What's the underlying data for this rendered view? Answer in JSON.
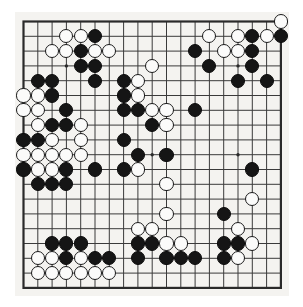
{
  "figure": {
    "name": "go-board-position",
    "board_size": 19,
    "colors": {
      "board_background": "#f4f3f0",
      "grid_line": "#3a3a3a",
      "border_line": "#2a2a2a",
      "black_stone": "#151515",
      "white_stone": "#fbfbfa",
      "page_background": "#ffffff"
    },
    "geometry": {
      "origin_x": 8.5,
      "origin_y": 9.5,
      "step_x": 14.3,
      "step_y": 14.8,
      "stone_diameter": 14.2,
      "border_width": 2.2,
      "grid_width": 1.0
    },
    "star_points": [
      [
        3,
        3
      ],
      [
        9,
        3
      ],
      [
        15,
        3
      ],
      [
        3,
        9
      ],
      [
        9,
        9
      ],
      [
        15,
        9
      ],
      [
        3,
        15
      ],
      [
        9,
        15
      ],
      [
        15,
        15
      ]
    ],
    "stones": [
      {
        "c": 3,
        "r": 1,
        "color": "white"
      },
      {
        "c": 4,
        "r": 1,
        "color": "white"
      },
      {
        "c": 5,
        "r": 1,
        "color": "black"
      },
      {
        "c": 13,
        "r": 1,
        "color": "white"
      },
      {
        "c": 15,
        "r": 1,
        "color": "white"
      },
      {
        "c": 16,
        "r": 1,
        "color": "black"
      },
      {
        "c": 17,
        "r": 1,
        "color": "white"
      },
      {
        "c": 18,
        "r": 1,
        "color": "black"
      },
      {
        "c": 18,
        "r": 0,
        "color": "white"
      },
      {
        "c": 2,
        "r": 2,
        "color": "white"
      },
      {
        "c": 3,
        "r": 2,
        "color": "white"
      },
      {
        "c": 4,
        "r": 2,
        "color": "black"
      },
      {
        "c": 5,
        "r": 2,
        "color": "white"
      },
      {
        "c": 6,
        "r": 2,
        "color": "white"
      },
      {
        "c": 12,
        "r": 2,
        "color": "black"
      },
      {
        "c": 14,
        "r": 2,
        "color": "white"
      },
      {
        "c": 15,
        "r": 2,
        "color": "white"
      },
      {
        "c": 16,
        "r": 2,
        "color": "black"
      },
      {
        "c": 4,
        "r": 3,
        "color": "black"
      },
      {
        "c": 5,
        "r": 3,
        "color": "black"
      },
      {
        "c": 9,
        "r": 3,
        "color": "white"
      },
      {
        "c": 13,
        "r": 3,
        "color": "black"
      },
      {
        "c": 16,
        "r": 3,
        "color": "black"
      },
      {
        "c": 1,
        "r": 4,
        "color": "black"
      },
      {
        "c": 2,
        "r": 4,
        "color": "black"
      },
      {
        "c": 5,
        "r": 4,
        "color": "black"
      },
      {
        "c": 7,
        "r": 4,
        "color": "black"
      },
      {
        "c": 8,
        "r": 4,
        "color": "white"
      },
      {
        "c": 15,
        "r": 4,
        "color": "black"
      },
      {
        "c": 17,
        "r": 4,
        "color": "black"
      },
      {
        "c": 0,
        "r": 5,
        "color": "white"
      },
      {
        "c": 1,
        "r": 5,
        "color": "white"
      },
      {
        "c": 2,
        "r": 5,
        "color": "black"
      },
      {
        "c": 7,
        "r": 5,
        "color": "black"
      },
      {
        "c": 8,
        "r": 5,
        "color": "white"
      },
      {
        "c": 0,
        "r": 6,
        "color": "white"
      },
      {
        "c": 1,
        "r": 6,
        "color": "white"
      },
      {
        "c": 3,
        "r": 6,
        "color": "black"
      },
      {
        "c": 7,
        "r": 6,
        "color": "black"
      },
      {
        "c": 8,
        "r": 6,
        "color": "black"
      },
      {
        "c": 9,
        "r": 6,
        "color": "white"
      },
      {
        "c": 10,
        "r": 6,
        "color": "white"
      },
      {
        "c": 12,
        "r": 6,
        "color": "black"
      },
      {
        "c": 1,
        "r": 7,
        "color": "white"
      },
      {
        "c": 2,
        "r": 7,
        "color": "black"
      },
      {
        "c": 3,
        "r": 7,
        "color": "black"
      },
      {
        "c": 4,
        "r": 7,
        "color": "white"
      },
      {
        "c": 9,
        "r": 7,
        "color": "black"
      },
      {
        "c": 10,
        "r": 7,
        "color": "white"
      },
      {
        "c": 0,
        "r": 8,
        "color": "black"
      },
      {
        "c": 1,
        "r": 8,
        "color": "black"
      },
      {
        "c": 2,
        "r": 8,
        "color": "white"
      },
      {
        "c": 4,
        "r": 8,
        "color": "white"
      },
      {
        "c": 7,
        "r": 8,
        "color": "black"
      },
      {
        "c": 0,
        "r": 9,
        "color": "white"
      },
      {
        "c": 1,
        "r": 9,
        "color": "white"
      },
      {
        "c": 2,
        "r": 9,
        "color": "white"
      },
      {
        "c": 3,
        "r": 9,
        "color": "white"
      },
      {
        "c": 4,
        "r": 9,
        "color": "white"
      },
      {
        "c": 8,
        "r": 9,
        "color": "black"
      },
      {
        "c": 10,
        "r": 9,
        "color": "black"
      },
      {
        "c": 0,
        "r": 10,
        "color": "black"
      },
      {
        "c": 1,
        "r": 10,
        "color": "white"
      },
      {
        "c": 2,
        "r": 10,
        "color": "white"
      },
      {
        "c": 3,
        "r": 10,
        "color": "black"
      },
      {
        "c": 5,
        "r": 10,
        "color": "black"
      },
      {
        "c": 7,
        "r": 10,
        "color": "black"
      },
      {
        "c": 8,
        "r": 10,
        "color": "white"
      },
      {
        "c": 16,
        "r": 10,
        "color": "black"
      },
      {
        "c": 1,
        "r": 11,
        "color": "black"
      },
      {
        "c": 2,
        "r": 11,
        "color": "black"
      },
      {
        "c": 3,
        "r": 11,
        "color": "black"
      },
      {
        "c": 10,
        "r": 11,
        "color": "white"
      },
      {
        "c": 16,
        "r": 12,
        "color": "white"
      },
      {
        "c": 10,
        "r": 13,
        "color": "white"
      },
      {
        "c": 14,
        "r": 13,
        "color": "black"
      },
      {
        "c": 8,
        "r": 14,
        "color": "white"
      },
      {
        "c": 9,
        "r": 14,
        "color": "white"
      },
      {
        "c": 15,
        "r": 14,
        "color": "white"
      },
      {
        "c": 2,
        "r": 15,
        "color": "black"
      },
      {
        "c": 3,
        "r": 15,
        "color": "black"
      },
      {
        "c": 4,
        "r": 15,
        "color": "black"
      },
      {
        "c": 8,
        "r": 15,
        "color": "black"
      },
      {
        "c": 9,
        "r": 15,
        "color": "black"
      },
      {
        "c": 10,
        "r": 15,
        "color": "white"
      },
      {
        "c": 11,
        "r": 15,
        "color": "white"
      },
      {
        "c": 14,
        "r": 15,
        "color": "black"
      },
      {
        "c": 15,
        "r": 15,
        "color": "black"
      },
      {
        "c": 16,
        "r": 15,
        "color": "white"
      },
      {
        "c": 1,
        "r": 16,
        "color": "white"
      },
      {
        "c": 2,
        "r": 16,
        "color": "white"
      },
      {
        "c": 3,
        "r": 16,
        "color": "black"
      },
      {
        "c": 4,
        "r": 16,
        "color": "white"
      },
      {
        "c": 5,
        "r": 16,
        "color": "black"
      },
      {
        "c": 6,
        "r": 16,
        "color": "black"
      },
      {
        "c": 8,
        "r": 16,
        "color": "black"
      },
      {
        "c": 10,
        "r": 16,
        "color": "black"
      },
      {
        "c": 11,
        "r": 16,
        "color": "black"
      },
      {
        "c": 12,
        "r": 16,
        "color": "black"
      },
      {
        "c": 14,
        "r": 16,
        "color": "black"
      },
      {
        "c": 15,
        "r": 16,
        "color": "white"
      },
      {
        "c": 1,
        "r": 17,
        "color": "white"
      },
      {
        "c": 2,
        "r": 17,
        "color": "white"
      },
      {
        "c": 3,
        "r": 17,
        "color": "white"
      },
      {
        "c": 4,
        "r": 17,
        "color": "white"
      },
      {
        "c": 5,
        "r": 17,
        "color": "white"
      },
      {
        "c": 6,
        "r": 17,
        "color": "white"
      }
    ]
  }
}
